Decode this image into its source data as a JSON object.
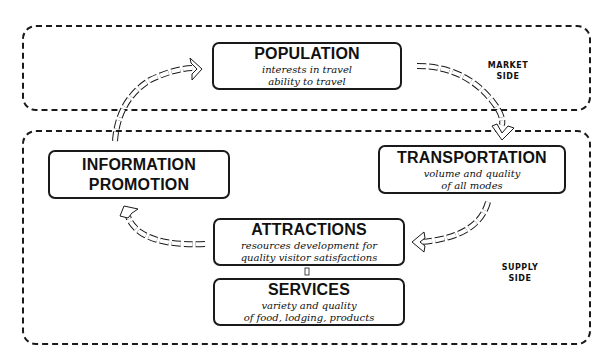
{
  "regions": {
    "market": {
      "label_line1": "MARKET",
      "label_line2": "SIDE"
    },
    "supply": {
      "label_line1": "SUPPLY",
      "label_line2": "SIDE"
    }
  },
  "nodes": {
    "population": {
      "title": "POPULATION",
      "sub_line1": "interests in travel",
      "sub_line2": "ability to travel"
    },
    "information_promotion": {
      "title_line1": "INFORMATION",
      "title_line2": "PROMOTION"
    },
    "transportation": {
      "title": "TRANSPORTATION",
      "sub_line1": "volume and quality",
      "sub_line2": "of all modes"
    },
    "attractions": {
      "title": "ATTRACTIONS",
      "sub_line1": "resources development for",
      "sub_line2": "quality visitor satisfactions"
    },
    "services": {
      "title": "SERVICES",
      "sub_line1": "variety and quality",
      "sub_line2": "of food, lodging, products"
    }
  },
  "flow": [
    {
      "from": "population",
      "to": "transportation"
    },
    {
      "from": "transportation",
      "to": "attractions"
    },
    {
      "from": "attractions",
      "to": "information_promotion"
    },
    {
      "from": "information_promotion",
      "to": "population"
    },
    {
      "from": "attractions",
      "to": "services",
      "style": "connector"
    }
  ]
}
